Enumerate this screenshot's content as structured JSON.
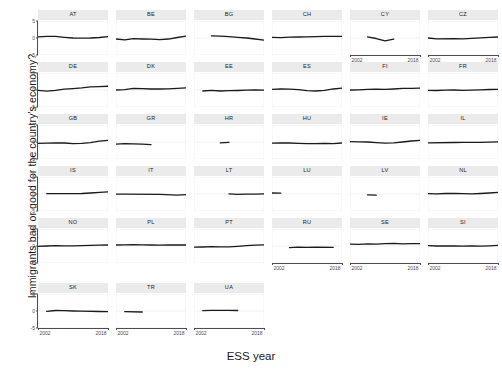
{
  "chart_data": {
    "type": "line",
    "title": "",
    "subtitle": "",
    "xlabel": "ESS year",
    "ylabel": "Immigrants bad or good for the country's economy?",
    "xlim": [
      2002,
      2018
    ],
    "ylim": [
      -5,
      5
    ],
    "x_ticks": [
      2002,
      2018
    ],
    "x_tick_labels": [
      "2002",
      "2018"
    ],
    "y_ticks": [
      -5,
      0,
      5
    ],
    "y_tick_labels": [
      "-5",
      "0",
      "5"
    ],
    "grid": true,
    "legend": "none",
    "line_color": "#1a1a1a",
    "facet_strip_color": "#ebebeb",
    "panel_background": "#ffffff",
    "grid_color": "#ebebeb",
    "facet_variable": "country",
    "facet_layout": {
      "columns": 6,
      "rows": 6
    },
    "panels": [
      {
        "country": "AT",
        "row": 1,
        "col": 1,
        "x": [
          2002,
          2004,
          2006,
          2008,
          2010,
          2012,
          2014,
          2016,
          2018
        ],
        "y": [
          0.35,
          0.5,
          0.45,
          0.2,
          0.0,
          -0.05,
          0.0,
          0.15,
          0.4
        ]
      },
      {
        "country": "BE",
        "row": 1,
        "col": 2,
        "x": [
          2002,
          2004,
          2006,
          2008,
          2010,
          2012,
          2014,
          2016,
          2018
        ],
        "y": [
          -0.3,
          -0.55,
          -0.2,
          -0.3,
          -0.35,
          -0.45,
          -0.3,
          0.15,
          0.55
        ]
      },
      {
        "country": "BG",
        "row": 1,
        "col": 3,
        "x": [
          2006,
          2008,
          2010,
          2012,
          2014,
          2016,
          2018
        ],
        "y": [
          0.6,
          0.55,
          0.4,
          0.2,
          0.0,
          -0.3,
          -0.6
        ]
      },
      {
        "country": "CH",
        "row": 1,
        "col": 4,
        "x": [
          2002,
          2004,
          2006,
          2008,
          2010,
          2012,
          2014,
          2016,
          2018
        ],
        "y": [
          0.2,
          0.1,
          0.25,
          0.3,
          0.35,
          0.4,
          0.45,
          0.5,
          0.45
        ]
      },
      {
        "country": "CY",
        "row": 1,
        "col": 5,
        "x": [
          2006,
          2008,
          2010,
          2012
        ],
        "y": [
          0.3,
          -0.15,
          -0.85,
          -0.3
        ]
      },
      {
        "country": "CZ",
        "row": 1,
        "col": 6,
        "x": [
          2002,
          2004,
          2008,
          2010,
          2012,
          2014,
          2016,
          2018
        ],
        "y": [
          0.0,
          -0.25,
          -0.2,
          -0.25,
          -0.1,
          0.05,
          0.2,
          0.3
        ]
      },
      {
        "country": "DE",
        "row": 2,
        "col": 1,
        "x": [
          2002,
          2004,
          2006,
          2008,
          2010,
          2012,
          2014,
          2016,
          2018
        ],
        "y": [
          -0.1,
          -0.35,
          -0.1,
          0.25,
          0.4,
          0.6,
          0.9,
          1.0,
          1.1
        ]
      },
      {
        "country": "DK",
        "row": 2,
        "col": 2,
        "x": [
          2002,
          2004,
          2006,
          2008,
          2010,
          2012,
          2014,
          2016,
          2018
        ],
        "y": [
          0.0,
          0.1,
          0.45,
          0.4,
          0.3,
          0.3,
          0.35,
          0.5,
          0.6
        ]
      },
      {
        "country": "EE",
        "row": 2,
        "col": 3,
        "x": [
          2004,
          2006,
          2008,
          2010,
          2012,
          2014,
          2016,
          2018
        ],
        "y": [
          -0.3,
          -0.1,
          -0.3,
          -0.2,
          -0.15,
          -0.05,
          0.0,
          -0.05
        ]
      },
      {
        "country": "ES",
        "row": 2,
        "col": 4,
        "x": [
          2002,
          2004,
          2006,
          2008,
          2010,
          2012,
          2014,
          2016,
          2018
        ],
        "y": [
          0.2,
          0.3,
          0.25,
          0.1,
          -0.2,
          -0.3,
          -0.1,
          0.3,
          0.55
        ]
      },
      {
        "country": "FI",
        "row": 2,
        "col": 5,
        "x": [
          2002,
          2004,
          2006,
          2008,
          2010,
          2012,
          2014,
          2016,
          2018
        ],
        "y": [
          0.0,
          0.05,
          0.2,
          0.25,
          0.2,
          0.3,
          0.45,
          0.5,
          0.55
        ]
      },
      {
        "country": "FR",
        "row": 2,
        "col": 6,
        "x": [
          2002,
          2004,
          2006,
          2008,
          2010,
          2012,
          2014,
          2016,
          2018
        ],
        "y": [
          -0.1,
          -0.15,
          -0.05,
          0.0,
          -0.1,
          -0.05,
          0.05,
          0.15,
          0.2
        ]
      },
      {
        "country": "GB",
        "row": 3,
        "col": 1,
        "x": [
          2002,
          2004,
          2006,
          2008,
          2010,
          2012,
          2014,
          2016,
          2018
        ],
        "y": [
          -0.4,
          -0.35,
          -0.3,
          -0.3,
          -0.45,
          -0.4,
          -0.2,
          0.25,
          0.5
        ]
      },
      {
        "country": "GR",
        "row": 3,
        "col": 2,
        "x": [
          2002,
          2004,
          2008,
          2010
        ],
        "y": [
          -0.65,
          -0.5,
          -0.6,
          -0.8
        ]
      },
      {
        "country": "HR",
        "row": 3,
        "col": 3,
        "x": [
          2008,
          2010
        ],
        "y": [
          -0.25,
          -0.1
        ]
      },
      {
        "country": "HU",
        "row": 3,
        "col": 4,
        "x": [
          2002,
          2004,
          2006,
          2008,
          2010,
          2012,
          2014,
          2016,
          2018
        ],
        "y": [
          -0.35,
          -0.25,
          -0.3,
          -0.4,
          -0.45,
          -0.5,
          -0.4,
          -0.45,
          -0.3
        ]
      },
      {
        "country": "IE",
        "row": 3,
        "col": 5,
        "x": [
          2002,
          2004,
          2006,
          2008,
          2010,
          2012,
          2014,
          2016,
          2018
        ],
        "y": [
          0.1,
          0.05,
          0.0,
          -0.2,
          -0.35,
          -0.25,
          0.0,
          0.3,
          0.45
        ]
      },
      {
        "country": "IL",
        "row": 3,
        "col": 6,
        "x": [
          2002,
          2008,
          2010,
          2012,
          2014,
          2016,
          2018
        ],
        "y": [
          -0.25,
          -0.15,
          -0.1,
          -0.1,
          -0.1,
          -0.05,
          0.05
        ]
      },
      {
        "country": "IS",
        "row": 4,
        "col": 1,
        "x": [
          2004,
          2012,
          2014,
          2016,
          2018
        ],
        "y": [
          0.1,
          0.15,
          0.3,
          0.5,
          0.6
        ]
      },
      {
        "country": "IT",
        "row": 4,
        "col": 2,
        "x": [
          2002,
          2004,
          2012,
          2016,
          2018
        ],
        "y": [
          -0.05,
          -0.05,
          -0.1,
          -0.35,
          -0.2
        ]
      },
      {
        "country": "LT",
        "row": 4,
        "col": 3,
        "x": [
          2010,
          2012,
          2014,
          2016,
          2018
        ],
        "y": [
          0.05,
          -0.1,
          -0.05,
          -0.05,
          0.05
        ]
      },
      {
        "country": "LU",
        "row": 4,
        "col": 4,
        "x": [
          2002,
          2004
        ],
        "y": [
          0.3,
          0.25
        ]
      },
      {
        "country": "LV",
        "row": 4,
        "col": 5,
        "x": [
          2006,
          2008
        ],
        "y": [
          -0.25,
          -0.35
        ]
      },
      {
        "country": "NL",
        "row": 4,
        "col": 6,
        "x": [
          2002,
          2004,
          2006,
          2008,
          2010,
          2012,
          2014,
          2016,
          2018
        ],
        "y": [
          0.1,
          0.05,
          0.15,
          0.15,
          0.1,
          0.05,
          0.15,
          0.3,
          0.45
        ]
      },
      {
        "country": "NO",
        "row": 5,
        "col": 1,
        "x": [
          2002,
          2004,
          2006,
          2008,
          2010,
          2012,
          2014,
          2016,
          2018
        ],
        "y": [
          -0.1,
          0.0,
          0.1,
          0.05,
          0.05,
          0.1,
          0.2,
          0.25,
          0.3
        ]
      },
      {
        "country": "PL",
        "row": 5,
        "col": 2,
        "x": [
          2002,
          2004,
          2006,
          2008,
          2010,
          2012,
          2014,
          2016,
          2018
        ],
        "y": [
          0.3,
          0.35,
          0.4,
          0.35,
          0.3,
          0.25,
          0.3,
          0.35,
          0.3
        ]
      },
      {
        "country": "PT",
        "row": 5,
        "col": 3,
        "x": [
          2002,
          2004,
          2006,
          2008,
          2010,
          2012,
          2014,
          2016,
          2018
        ],
        "y": [
          -0.35,
          -0.3,
          -0.2,
          -0.25,
          -0.25,
          -0.1,
          0.1,
          0.25,
          0.35
        ]
      },
      {
        "country": "RU",
        "row": 5,
        "col": 4,
        "x": [
          2006,
          2008,
          2010,
          2012,
          2016
        ],
        "y": [
          -0.5,
          -0.35,
          -0.4,
          -0.35,
          -0.4
        ]
      },
      {
        "country": "SE",
        "row": 5,
        "col": 5,
        "x": [
          2002,
          2004,
          2006,
          2008,
          2010,
          2012,
          2014,
          2016,
          2018
        ],
        "y": [
          0.55,
          0.5,
          0.6,
          0.55,
          0.7,
          0.75,
          0.65,
          0.7,
          0.7
        ]
      },
      {
        "country": "SI",
        "row": 5,
        "col": 6,
        "x": [
          2002,
          2004,
          2006,
          2008,
          2010,
          2012,
          2014,
          2016,
          2018
        ],
        "y": [
          0.1,
          0.0,
          0.05,
          0.0,
          -0.05,
          0.05,
          -0.05,
          0.05,
          0.2
        ]
      },
      {
        "country": "SK",
        "row": 6,
        "col": 1,
        "x": [
          2004,
          2006,
          2008,
          2010,
          2012,
          2016,
          2018
        ],
        "y": [
          -0.1,
          0.15,
          0.1,
          0.0,
          -0.05,
          -0.15,
          -0.2
        ]
      },
      {
        "country": "TR",
        "row": 6,
        "col": 2,
        "x": [
          2004,
          2008
        ],
        "y": [
          -0.2,
          -0.3
        ]
      },
      {
        "country": "UA",
        "row": 6,
        "col": 3,
        "x": [
          2004,
          2006,
          2008,
          2010,
          2012
        ],
        "y": [
          0.1,
          0.2,
          0.2,
          0.2,
          0.15
        ]
      }
    ],
    "x_axis_panels": [
      "CY",
      "CZ",
      "RU",
      "SE",
      "SI",
      "SK",
      "TR",
      "UA"
    ]
  }
}
